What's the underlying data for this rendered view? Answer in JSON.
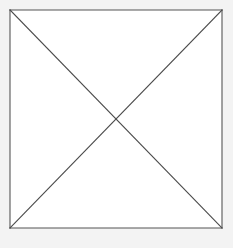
{
  "figure": {
    "canvas": {
      "width": 233,
      "height": 248,
      "background_color": "#ffffff",
      "margin_color": "#f3f3f3"
    },
    "style": {
      "stroke_color": "#4a4a4a",
      "outline_stroke_color": "#555555",
      "stroke_width": 1,
      "fill": "none",
      "line_cap": "square"
    },
    "square": {
      "name": "outer-square",
      "left": 10,
      "top": 10,
      "right": 222,
      "bottom": 228,
      "width": 212,
      "height": 218
    },
    "center_point": {
      "x": 116,
      "y": 119,
      "label": "diagonal-intersection"
    },
    "vertices": [
      {
        "label": "top-left",
        "x": 10,
        "y": 10
      },
      {
        "label": "top-right",
        "x": 222,
        "y": 10
      },
      {
        "label": "bottom-right",
        "x": 222,
        "y": 228
      },
      {
        "label": "bottom-left",
        "x": 10,
        "y": 228
      }
    ],
    "edges": [
      {
        "label": "top-edge",
        "x1": 10,
        "y1": 10,
        "x2": 222,
        "y2": 10
      },
      {
        "label": "right-edge",
        "x1": 222,
        "y1": 10,
        "x2": 222,
        "y2": 228
      },
      {
        "label": "bottom-edge",
        "x1": 222,
        "y1": 228,
        "x2": 10,
        "y2": 228
      },
      {
        "label": "left-edge",
        "x1": 10,
        "y1": 228,
        "x2": 10,
        "y2": 10
      }
    ],
    "diagonals": [
      {
        "label": "diagonal-tl-br",
        "x1": 10,
        "y1": 10,
        "x2": 222,
        "y2": 228
      },
      {
        "label": "diagonal-tr-bl",
        "x1": 222,
        "y1": 10,
        "x2": 10,
        "y2": 228
      }
    ],
    "regions": [
      {
        "label": "top-triangle"
      },
      {
        "label": "right-triangle"
      },
      {
        "label": "bottom-triangle"
      },
      {
        "label": "left-triangle"
      }
    ],
    "labels": [],
    "annotations": []
  }
}
